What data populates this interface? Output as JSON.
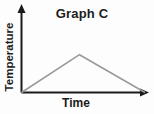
{
  "chart_data": {
    "type": "line",
    "title": "Graph C",
    "xlabel": "Time",
    "ylabel": "Temperature",
    "x": [
      0,
      0.46,
      0.98
    ],
    "y": [
      0,
      0.45,
      0
    ],
    "series": [
      {
        "name": "Temperature vs Time",
        "points": [
          [
            0,
            0
          ],
          [
            0.46,
            0.45
          ],
          [
            0.98,
            0
          ]
        ]
      }
    ],
    "xlim": [
      0,
      1
    ],
    "ylim": [
      0,
      1
    ],
    "tick_labels": "none",
    "grid": false,
    "legend": "none",
    "axes_have_arrowheads": true
  },
  "colors": {
    "background": "#fdfdfd",
    "axis": "#1a1a1a",
    "line": "#9a9a9a",
    "text": "#1c1c1c"
  }
}
